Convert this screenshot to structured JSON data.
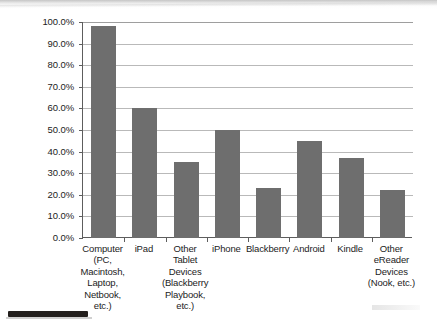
{
  "chart_data": {
    "type": "bar",
    "title": "",
    "subtitle": "",
    "xlabel": "",
    "ylabel": "",
    "ylim": [
      0,
      100
    ],
    "grid": true,
    "legend": false,
    "y_tick_labels": [
      "100.0%",
      "90.0%",
      "80.0%",
      "70.0%",
      "60.0%",
      "50.0%",
      "40.0%",
      "30.0%",
      "20.0%",
      "10.0%",
      "0.0%"
    ],
    "y_tick_values": [
      100,
      90,
      80,
      70,
      60,
      50,
      40,
      30,
      20,
      10,
      0
    ],
    "categories": [
      "Computer\n(PC,\nMacintosh,\nLaptop,\nNetbook,\netc.)",
      "iPad",
      "Other\nTablet\nDevices\n(Blackberry\nPlaybook,\netc.)",
      "iPhone",
      "Blackberry",
      "Android",
      "Kindle",
      "Other\neReader\nDevices\n(Nook, etc.)"
    ],
    "values": [
      98,
      60,
      35,
      50,
      23,
      45,
      37,
      22
    ],
    "series_name": "Device usage",
    "bar_color": "#6e6e6e",
    "gridline_color": "#b9b9b9",
    "axis_color": "#5d5d5d",
    "background_color": "#ffffff"
  },
  "artifacts": {
    "top_shadow": "scan-page-shadow",
    "bottom_bar": "scan-page-edge-mark",
    "right_smudge": "scan-page-smudge"
  }
}
